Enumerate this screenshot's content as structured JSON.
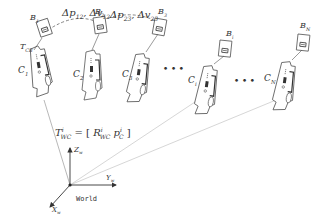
{
  "diagram": {
    "colors": {
      "stroke": "#555555",
      "light_stroke": "#aaaaaa",
      "text": "#333333"
    },
    "edge_labels": [
      {
        "main": "Δp",
        "sub1": "12",
        "sep": ", Δv",
        "sub2": "12"
      },
      {
        "main": "Δp",
        "sub1": "23",
        "sep": ", Δv",
        "sub2": "23"
      }
    ],
    "boards": [
      {
        "main": "B",
        "sub": "1"
      },
      {
        "main": "B",
        "sub": "2"
      },
      {
        "main": "B",
        "sub": "3"
      },
      {
        "main": "B",
        "sub": "i"
      },
      {
        "main": "B",
        "sub": "N"
      }
    ],
    "cameras": [
      {
        "main": "C",
        "sub": "1"
      },
      {
        "main": "C",
        "sub": "2"
      },
      {
        "main": "C",
        "sub": "3"
      },
      {
        "main": "C",
        "sub": "i"
      },
      {
        "main": "C",
        "sub": "N"
      }
    ],
    "extrinsic_label": {
      "main": "T",
      "sub": "CB"
    },
    "ellipsis": [
      "• • •",
      "• • •"
    ],
    "pose_equation": {
      "lhs_main": "T",
      "lhs_sup": "i",
      "lhs_sub": "WC",
      "eq": " = [ ",
      "r_main": "R",
      "r_sup": "i",
      "r_sub": "WC",
      "sep": "  ",
      "p_main": "p",
      "p_sup": "i",
      "p_sub": "C",
      "close": " ]"
    },
    "axes": {
      "z": {
        "main": "Z",
        "sub": "w"
      },
      "y": {
        "main": "Y",
        "sub": "w"
      },
      "x": {
        "main": "X",
        "sub": "w"
      },
      "origin_label": "World"
    }
  }
}
